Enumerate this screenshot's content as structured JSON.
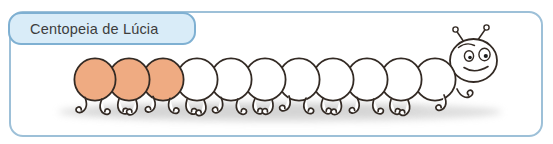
{
  "label": {
    "text": "Centopeia de Lúcia"
  },
  "illustration": {
    "name": "centopeia-de-lucia",
    "body_segments_total": 11,
    "segments_painted_orange": 3,
    "segments_white": 8,
    "segment_colors": [
      "orange",
      "orange",
      "orange",
      "white",
      "white",
      "white",
      "white",
      "white",
      "white",
      "white",
      "white"
    ],
    "head": {
      "antennae": 2,
      "eyes": 2,
      "expression": "smile",
      "facing": "right"
    },
    "colors": {
      "segment_orange": "#efab82",
      "segment_white": "#ffffff",
      "outline": "#332a24",
      "frame_border": "#9dc0d8",
      "label_fill": "#d9ecf8",
      "label_border": "#7fb0d2",
      "label_text": "#3d3d3d",
      "shadow": "#c2c2c2"
    }
  }
}
